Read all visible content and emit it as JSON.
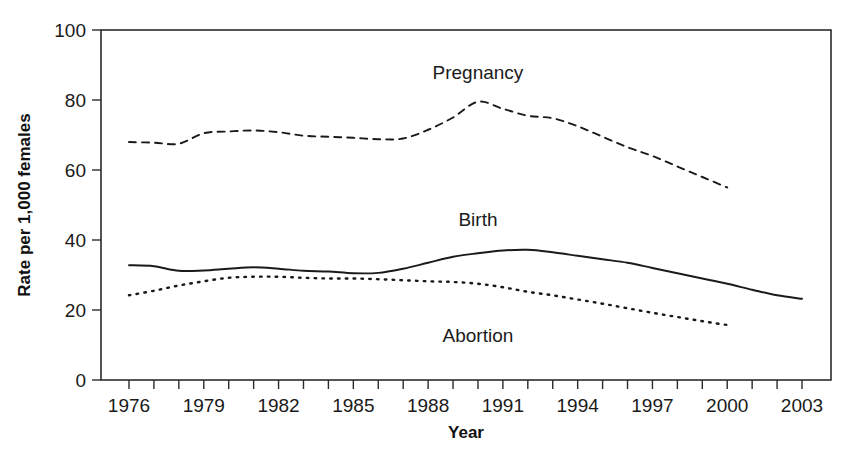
{
  "chart_data": {
    "type": "line",
    "title": "",
    "xlabel": "Year",
    "ylabel": "Rate per 1,000 females",
    "xlim": [
      1976,
      2003
    ],
    "ylim": [
      0,
      100
    ],
    "grid": false,
    "legend_position": "inline-labels",
    "x_tick_labels": [
      "1976",
      "1979",
      "1982",
      "1985",
      "1988",
      "1991",
      "1994",
      "1997",
      "2000",
      "2003"
    ],
    "x_tick_values": [
      1976,
      1979,
      1982,
      1985,
      1988,
      1991,
      1994,
      1997,
      2000,
      2003
    ],
    "x_minor_ticks": [
      1976,
      1977,
      1978,
      1979,
      1980,
      1981,
      1982,
      1983,
      1984,
      1985,
      1986,
      1987,
      1988,
      1989,
      1990,
      1991,
      1992,
      1993,
      1994,
      1995,
      1996,
      1997,
      1998,
      1999,
      2000,
      2001,
      2002,
      2003
    ],
    "y_tick_labels": [
      "0",
      "20",
      "40",
      "60",
      "80",
      "100"
    ],
    "y_tick_values": [
      0,
      20,
      40,
      60,
      80,
      100
    ],
    "series": [
      {
        "name": "Pregnancy",
        "style": "dashed",
        "label_text": "Pregnancy",
        "x": [
          1976,
          1977,
          1978,
          1979,
          1980,
          1981,
          1982,
          1983,
          1984,
          1985,
          1986,
          1987,
          1988,
          1989,
          1990,
          1991,
          1992,
          1993,
          1994,
          1995,
          1996,
          1997,
          1998,
          1999,
          2000
        ],
        "values": [
          68.0,
          67.8,
          67.5,
          70.5,
          71.0,
          71.3,
          70.8,
          69.8,
          69.5,
          69.2,
          68.8,
          69.0,
          71.5,
          75.0,
          79.5,
          77.5,
          75.5,
          74.8,
          72.5,
          69.5,
          66.5,
          64.0,
          61.0,
          58.0,
          55.0
        ]
      },
      {
        "name": "Birth",
        "style": "solid",
        "label_text": "Birth",
        "x": [
          1976,
          1977,
          1978,
          1979,
          1980,
          1981,
          1982,
          1983,
          1984,
          1985,
          1986,
          1987,
          1988,
          1989,
          1990,
          1991,
          1992,
          1993,
          1994,
          1995,
          1996,
          1997,
          1998,
          1999,
          2000,
          2001,
          2002,
          2003
        ],
        "values": [
          32.8,
          32.5,
          31.2,
          31.3,
          31.8,
          32.2,
          31.8,
          31.2,
          31.0,
          30.5,
          30.6,
          31.8,
          33.5,
          35.2,
          36.2,
          37.0,
          37.2,
          36.5,
          35.5,
          34.5,
          33.5,
          32.0,
          30.5,
          29.0,
          27.5,
          25.8,
          24.2,
          23.2
        ]
      },
      {
        "name": "Abortion",
        "style": "dotted",
        "label_text": "Abortion",
        "x": [
          1976,
          1977,
          1978,
          1979,
          1980,
          1981,
          1982,
          1983,
          1984,
          1985,
          1986,
          1987,
          1988,
          1989,
          1990,
          1991,
          1992,
          1993,
          1994,
          1995,
          1996,
          1997,
          1998,
          1999,
          2000
        ],
        "values": [
          24.2,
          25.5,
          27.0,
          28.2,
          29.2,
          29.5,
          29.5,
          29.2,
          29.0,
          29.0,
          28.8,
          28.5,
          28.2,
          28.0,
          27.5,
          26.5,
          25.2,
          24.2,
          23.0,
          21.8,
          20.5,
          19.2,
          18.0,
          16.8,
          15.7
        ]
      }
    ],
    "annotations": [
      {
        "text": "Pregnancy",
        "x": 1990,
        "y": 86
      },
      {
        "text": "Birth",
        "x": 1990,
        "y": 44
      },
      {
        "text": "Abortion",
        "x": 1990,
        "y": 11
      }
    ]
  },
  "axes": {
    "y_axis_title": "Rate per 1,000 females",
    "x_axis_title": "Year"
  }
}
